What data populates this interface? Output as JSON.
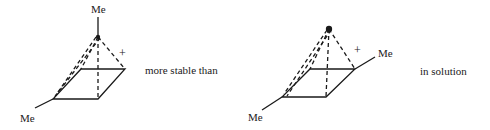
{
  "diagram": {
    "left_structure": {
      "apex_label": "Me",
      "base_label": "Me",
      "charge": "+"
    },
    "comparison_text": "more stable than",
    "right_structure": {
      "side_label": "Me",
      "base_label": "Me",
      "charge": "+"
    },
    "condition_text": "in solution",
    "colors": {
      "ink": "#1a1a1a",
      "background": "#ffffff"
    }
  }
}
